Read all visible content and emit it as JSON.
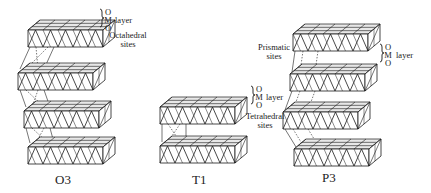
{
  "figure": {
    "structures": [
      {
        "id": "O3",
        "caption": "O3",
        "site_label": [
          "Octahedral",
          "sites"
        ],
        "layer_label": {
          "letters": [
            "O",
            "M",
            "O"
          ],
          "word": "layer"
        },
        "slabs": [
          {
            "x": 28,
            "y": 30
          },
          {
            "x": 18,
            "y": 73
          },
          {
            "x": 24,
            "y": 111
          },
          {
            "x": 28,
            "y": 147
          }
        ]
      },
      {
        "id": "T1",
        "caption": "T1",
        "site_label": [
          "Tetrahedral",
          "sites"
        ],
        "layer_label": {
          "letters": [
            "O",
            "M",
            "O"
          ],
          "word": "layer"
        },
        "slabs": [
          {
            "x": 160,
            "y": 107
          },
          {
            "x": 160,
            "y": 146
          }
        ]
      },
      {
        "id": "P3",
        "caption": "P3",
        "site_label": [
          "Prismatic",
          "sites"
        ],
        "layer_label": {
          "letters": [
            "O",
            "M",
            "O"
          ],
          "word": "layer"
        },
        "slabs": [
          {
            "x": 293,
            "y": 34
          },
          {
            "x": 290,
            "y": 74
          },
          {
            "x": 283,
            "y": 112
          },
          {
            "x": 294,
            "y": 149
          }
        ]
      }
    ],
    "colors": {
      "line": "#1a1a1a",
      "face": "#ffffff",
      "top": "#e8e8e8"
    }
  }
}
